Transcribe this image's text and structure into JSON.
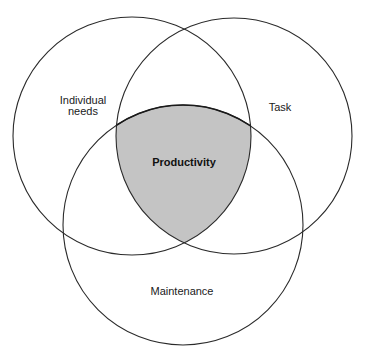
{
  "diagram": {
    "type": "venn",
    "colors": {
      "stroke": "#2a2a2a",
      "intersection_fill": "#c4c4c4",
      "background": "#ffffff"
    },
    "circles": [
      {
        "id": "individual",
        "label_lines": [
          "Individual",
          "needs"
        ]
      },
      {
        "id": "task",
        "label": "Task"
      },
      {
        "id": "maintenance",
        "label": "Maintenance"
      }
    ],
    "intersection": {
      "label": "Productivity"
    }
  }
}
